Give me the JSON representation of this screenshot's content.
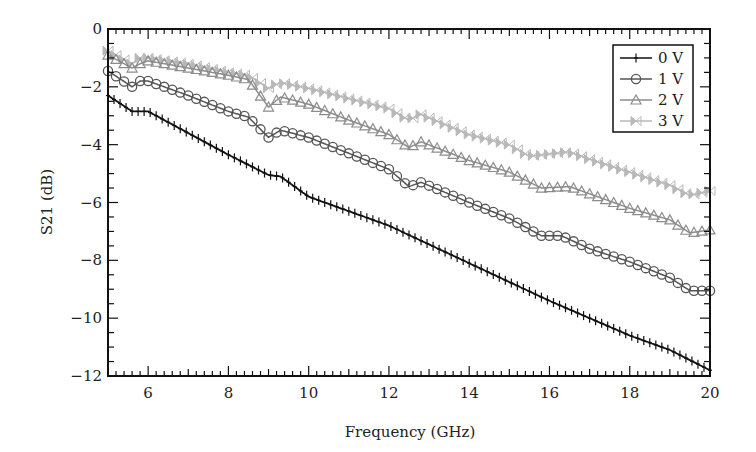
{
  "chart_data": {
    "type": "line",
    "title": "",
    "xlabel": "Frequency (GHz)",
    "ylabel": "S21 (dB)",
    "xlim": [
      5,
      20
    ],
    "ylim": [
      -12,
      0
    ],
    "xticks": [
      6,
      8,
      10,
      12,
      14,
      16,
      18,
      20
    ],
    "yticks": [
      0,
      -2,
      -4,
      -6,
      -8,
      -10,
      -12
    ],
    "xtick_labels": [
      "6",
      "8",
      "10",
      "12",
      "14",
      "16",
      "18",
      "20"
    ],
    "ytick_labels": [
      "0",
      "−2",
      "−4",
      "−6",
      "−8",
      "−10",
      "−12"
    ],
    "grid": false,
    "legend_position": "upper right",
    "series": [
      {
        "name": "0 V",
        "marker": "plus",
        "color": "#111111",
        "x": [
          5,
          5.6,
          6,
          7,
          8,
          9,
          9.3,
          10,
          11,
          12,
          13,
          14,
          15,
          16,
          17,
          18,
          19,
          20
        ],
        "values": [
          -2.3,
          -2.85,
          -2.85,
          -3.6,
          -4.35,
          -5.05,
          -5.1,
          -5.8,
          -6.3,
          -6.8,
          -7.45,
          -8.1,
          -8.75,
          -9.4,
          -10.0,
          -10.6,
          -11.1,
          -11.8
        ]
      },
      {
        "name": "1 V",
        "marker": "circle",
        "color": "#555555",
        "x": [
          5,
          5.6,
          5.8,
          6,
          7,
          8,
          8.5,
          9,
          9.3,
          10,
          11,
          12,
          12.5,
          12.8,
          14,
          15,
          15.8,
          16.3,
          17,
          18,
          19,
          19.5,
          20
        ],
        "values": [
          -1.45,
          -2.0,
          -1.8,
          -1.8,
          -2.3,
          -2.85,
          -3.05,
          -3.75,
          -3.5,
          -3.75,
          -4.3,
          -4.85,
          -5.45,
          -5.3,
          -6.0,
          -6.55,
          -7.15,
          -7.15,
          -7.6,
          -8.05,
          -8.6,
          -9.05,
          -9.05
        ]
      },
      {
        "name": "2 V",
        "marker": "triangle",
        "color": "#8c8c8c",
        "x": [
          5,
          5.6,
          5.8,
          6,
          7,
          8,
          8.5,
          9,
          9.3,
          10,
          11,
          12,
          12.5,
          12.8,
          14,
          15,
          15.8,
          16.5,
          17,
          18,
          19,
          19.5,
          20
        ],
        "values": [
          -0.9,
          -1.35,
          -1.2,
          -1.1,
          -1.35,
          -1.6,
          -1.75,
          -2.7,
          -2.35,
          -2.6,
          -3.15,
          -3.65,
          -4.1,
          -3.9,
          -4.55,
          -4.95,
          -5.5,
          -5.45,
          -5.7,
          -6.2,
          -6.6,
          -7.05,
          -6.95
        ]
      },
      {
        "name": "3 V",
        "marker": "bowtie",
        "color": "#b8b8b8",
        "x": [
          5,
          5.6,
          5.8,
          6,
          7,
          8,
          8.5,
          9,
          9.3,
          10,
          11,
          12,
          12.5,
          12.8,
          14,
          15,
          15.5,
          16.5,
          17,
          18,
          19,
          19.5,
          20
        ],
        "values": [
          -0.75,
          -1.2,
          -1.0,
          -1.0,
          -1.2,
          -1.5,
          -1.6,
          -2.05,
          -1.85,
          -2.05,
          -2.4,
          -2.75,
          -3.15,
          -2.95,
          -3.65,
          -4.0,
          -4.4,
          -4.25,
          -4.5,
          -4.95,
          -5.4,
          -5.75,
          -5.6
        ]
      }
    ]
  }
}
